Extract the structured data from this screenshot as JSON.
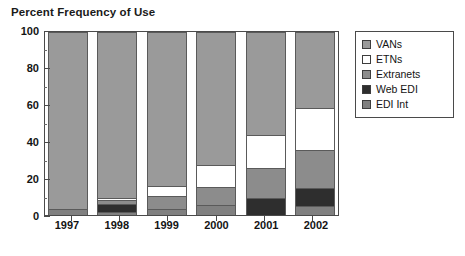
{
  "chart_data": {
    "type": "bar",
    "subtype": "stacked-bar-100-percent",
    "title": "Percent Frequency of Use",
    "xlabel": "",
    "ylabel": "",
    "ylim": [
      0,
      100
    ],
    "ytick_labels": [
      "0",
      "20",
      "40",
      "60",
      "80",
      "100"
    ],
    "ytick_values": [
      0,
      20,
      40,
      60,
      80,
      100
    ],
    "minor_ticks": [
      10,
      30,
      50,
      70,
      90
    ],
    "grid": false,
    "legend_position": "right",
    "categories": [
      "1997",
      "1998",
      "1999",
      "2000",
      "2001",
      "2002"
    ],
    "series": [
      {
        "name": "EDI Int",
        "color": "#808080",
        "values": [
          3.5,
          1.5,
          3.5,
          5.5,
          0,
          5.0
        ]
      },
      {
        "name": "Web EDI",
        "color": "#2e2e2e",
        "values": [
          0,
          4.5,
          0,
          0,
          9.5,
          9.5
        ]
      },
      {
        "name": "Extranets",
        "color": "#8c8c8c",
        "values": [
          0,
          2.0,
          7.0,
          10.0,
          16.0,
          21.0
        ]
      },
      {
        "name": "ETNs",
        "color": "#ffffff",
        "values": [
          0,
          1.5,
          5.5,
          12.0,
          18.0,
          23.0
        ]
      },
      {
        "name": "VANs",
        "color": "#9a9a9a",
        "values": [
          96.5,
          90.5,
          84.0,
          72.5,
          56.5,
          41.5
        ]
      }
    ],
    "stack_order_bottom_to_top": [
      "EDI Int",
      "Web EDI",
      "Extranets",
      "ETNs",
      "VANs"
    ]
  },
  "legend": {
    "items": [
      {
        "label": "VANs",
        "color": "#9a9a9a"
      },
      {
        "label": "ETNs",
        "color": "#ffffff"
      },
      {
        "label": "Extranets",
        "color": "#8c8c8c"
      },
      {
        "label": "Web EDI",
        "color": "#2e2e2e"
      },
      {
        "label": "EDI Int",
        "color": "#808080"
      }
    ]
  }
}
